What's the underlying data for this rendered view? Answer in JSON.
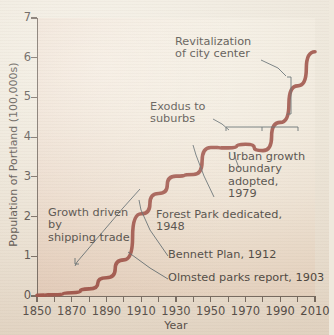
{
  "colors": {
    "line": "#9c4a3f",
    "axis": "#6d6258",
    "text": "#3c3833",
    "leader": "#4f5d63",
    "page_bg": "#efe9dd",
    "plot_bg": "#f6f0e3"
  },
  "chart_data": {
    "type": "line",
    "title": "",
    "xlabel": "Year",
    "ylabel": "Population of Portland (100,000s)",
    "xlim": [
      1850,
      2010
    ],
    "ylim": [
      0,
      7
    ],
    "x_ticks": [
      1850,
      1860,
      1870,
      1880,
      1890,
      1900,
      1910,
      1920,
      1930,
      1940,
      1950,
      1960,
      1970,
      1980,
      1990,
      2000,
      2010
    ],
    "x_tick_labels": [
      "1850",
      "",
      "1870",
      "",
      "1890",
      "",
      "1910",
      "",
      "1930",
      "",
      "1950",
      "",
      "1970",
      "",
      "1990",
      "",
      "2010"
    ],
    "y_ticks": [
      0,
      1,
      2,
      3,
      4,
      5,
      6,
      7
    ],
    "y_tick_labels": [
      "0",
      "1",
      "2",
      "3",
      "4",
      "5",
      "6",
      "7"
    ],
    "grid": false,
    "legend": "none",
    "series": [
      {
        "name": "Population of Portland",
        "x": [
          1850,
          1860,
          1870,
          1880,
          1890,
          1900,
          1910,
          1920,
          1930,
          1940,
          1950,
          1960,
          1970,
          1980,
          1990,
          2000,
          2010
        ],
        "values": [
          0.02,
          0.03,
          0.08,
          0.18,
          0.46,
          0.91,
          2.07,
          2.58,
          3.02,
          3.06,
          3.74,
          3.73,
          3.82,
          3.66,
          4.37,
          5.29,
          6.15
        ]
      }
    ],
    "annotations": [
      {
        "id": "growth-shipping",
        "text": "Growth driven by\nshipping trade",
        "points_to_x": 1905,
        "points_to_y": 0.75
      },
      {
        "id": "olmsted-1903",
        "text": "Olmsted parks report, 1903",
        "points_to_x": 1903,
        "points_to_y": 0.9
      },
      {
        "id": "bennett-1912",
        "text": "Bennett Plan, 1912",
        "points_to_x": 1912,
        "points_to_y": 2.2
      },
      {
        "id": "forest-park-1948",
        "text": "Forest Park dedicated,\n1948",
        "points_to_x": 1948,
        "points_to_y": 3.6
      },
      {
        "id": "exodus-suburbs",
        "text": "Exodus to\nsuburbs",
        "points_to_x": 1965,
        "points_to_y": 3.8
      },
      {
        "id": "urban-growth-1979",
        "text": "Urban growth\nboundary adopted,\n1979",
        "points_to_x": 1979,
        "points_to_y": 3.66
      },
      {
        "id": "revitalization",
        "text": "Revitalization\nof city center",
        "points_to_x": 1997,
        "points_to_y": 5.05
      }
    ]
  }
}
